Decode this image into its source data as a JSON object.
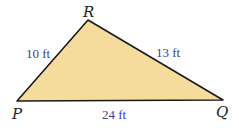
{
  "diagram": {
    "type": "triangle",
    "fill_color": "#f6dc9c",
    "stroke_color": "#1a1a1a",
    "label_color": "#3a3f8f",
    "vertices": [
      {
        "name": "P",
        "x": 17,
        "y": 101
      },
      {
        "name": "Q",
        "x": 223,
        "y": 100
      },
      {
        "name": "R",
        "x": 88,
        "y": 20
      }
    ],
    "labels": {
      "P": "P",
      "Q": "Q",
      "R": "R"
    },
    "sides": {
      "PR": "10 ft",
      "RQ": "13 ft",
      "PQ": "24 ft"
    }
  }
}
